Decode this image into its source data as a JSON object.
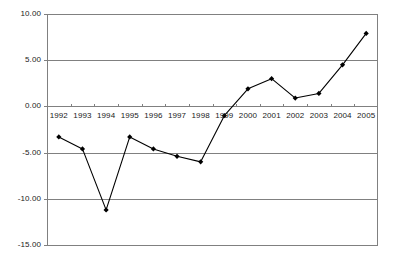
{
  "chart_data": {
    "type": "line",
    "title": "",
    "subtitle": "",
    "xlabel": "",
    "ylabel": "",
    "categories": [
      "1992",
      "1993",
      "1994",
      "1995",
      "1996",
      "1997",
      "1998",
      "1999",
      "2000",
      "2001",
      "2002",
      "2003",
      "2004",
      "2005"
    ],
    "values": [
      -3.3,
      -4.6,
      -11.2,
      -3.3,
      -4.6,
      -5.4,
      -6.0,
      -1.0,
      1.9,
      3.0,
      0.9,
      1.4,
      4.5,
      7.9
    ],
    "series": [
      {
        "name": "",
        "values": [
          -3.3,
          -4.6,
          -11.2,
          -3.3,
          -4.6,
          -5.4,
          -6.0,
          -1.0,
          1.9,
          3.0,
          0.9,
          1.4,
          4.5,
          7.9
        ]
      }
    ],
    "ylim": [
      -15.0,
      10.0
    ],
    "yticks": [
      10.0,
      5.0,
      0.0,
      -5.0,
      -10.0,
      -15.0
    ],
    "ytick_labels": [
      "10.00",
      "5.00",
      "0.00",
      "-5.00",
      "-10.00",
      "-15.00"
    ],
    "xtick_labels": [
      "1992",
      "1993",
      "1994",
      "1995",
      "1996",
      "1997",
      "1998",
      "1999",
      "2000",
      "2001",
      "2002",
      "2003",
      "2004",
      "2005"
    ],
    "grid": "horizontal",
    "legend": "none",
    "line_color": "#000000",
    "marker": "diamond",
    "marker_color": "#000000",
    "gridline_color": "#808080",
    "axis_color": "#808080",
    "background_color": "#ffffff",
    "annotations": []
  }
}
